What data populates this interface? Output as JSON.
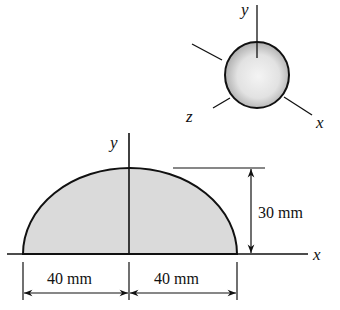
{
  "figure": {
    "type": "half-ellipse area with 3D ellipsoid inset",
    "colors": {
      "ink": "#111111",
      "fill": "#d9d9d9",
      "background": "#ffffff"
    }
  },
  "inset": {
    "description": "ellipsoid of revolution",
    "axes": {
      "y": "y",
      "z": "z",
      "x": "x"
    }
  },
  "main": {
    "axes": {
      "y": "y",
      "x": "x"
    },
    "dimensions": {
      "height": "30 mm",
      "left_half_width": "40 mm",
      "right_half_width": "40 mm"
    }
  }
}
